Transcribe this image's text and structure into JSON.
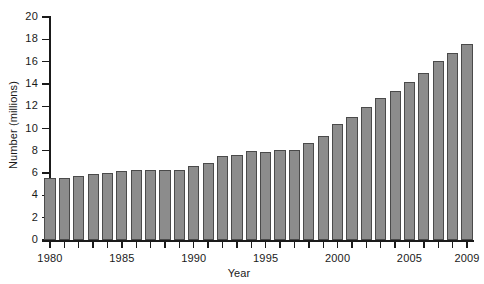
{
  "chart_data": {
    "type": "bar",
    "title": "",
    "xlabel": "Year",
    "ylabel": "Number (millions)",
    "ylim": [
      0,
      20
    ],
    "ytick_step": 2,
    "yticks": [
      0,
      2,
      4,
      6,
      8,
      10,
      12,
      14,
      16,
      18,
      20
    ],
    "ytick_labels": [
      "0",
      "2",
      "4",
      "6",
      "8",
      "10",
      "12",
      "14",
      "16",
      "18",
      "20"
    ],
    "xtick_labels": [
      "1980",
      "1985",
      "1990",
      "1995",
      "2000",
      "2005",
      "2009"
    ],
    "grid": false,
    "legend": false,
    "bar_color": "#8c8c8c",
    "bar_edge_color": "#4a4a4a",
    "axis_color": "#1a1a1a",
    "categories": [
      "1980",
      "1981",
      "1982",
      "1983",
      "1984",
      "1985",
      "1986",
      "1987",
      "1988",
      "1989",
      "1990",
      "1991",
      "1992",
      "1993",
      "1994",
      "1995",
      "1996",
      "1997",
      "1998",
      "1999",
      "2000",
      "2001",
      "2002",
      "2003",
      "2004",
      "2005",
      "2006",
      "2007",
      "2008",
      "2009"
    ],
    "values": [
      5.6,
      5.6,
      5.7,
      5.9,
      6.0,
      6.2,
      6.3,
      6.3,
      6.3,
      6.3,
      6.6,
      6.9,
      7.5,
      7.6,
      8.0,
      7.9,
      8.1,
      8.1,
      8.7,
      9.3,
      10.4,
      11.0,
      11.9,
      12.7,
      13.4,
      14.2,
      15.0,
      16.1,
      16.8,
      17.6
    ]
  }
}
